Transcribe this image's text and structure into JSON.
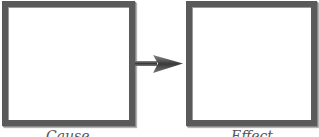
{
  "diagram": {
    "nodes": [
      {
        "id": "cause",
        "label": "Cause"
      },
      {
        "id": "effect",
        "label": "Effect"
      }
    ],
    "edges": [
      {
        "from": "cause",
        "to": "effect",
        "icon": "arrow-right-icon"
      }
    ],
    "colors": {
      "border": "#5a5a5a",
      "fill": "#ffffff",
      "arrow": "#4a4a4a",
      "label": "#555555"
    }
  }
}
